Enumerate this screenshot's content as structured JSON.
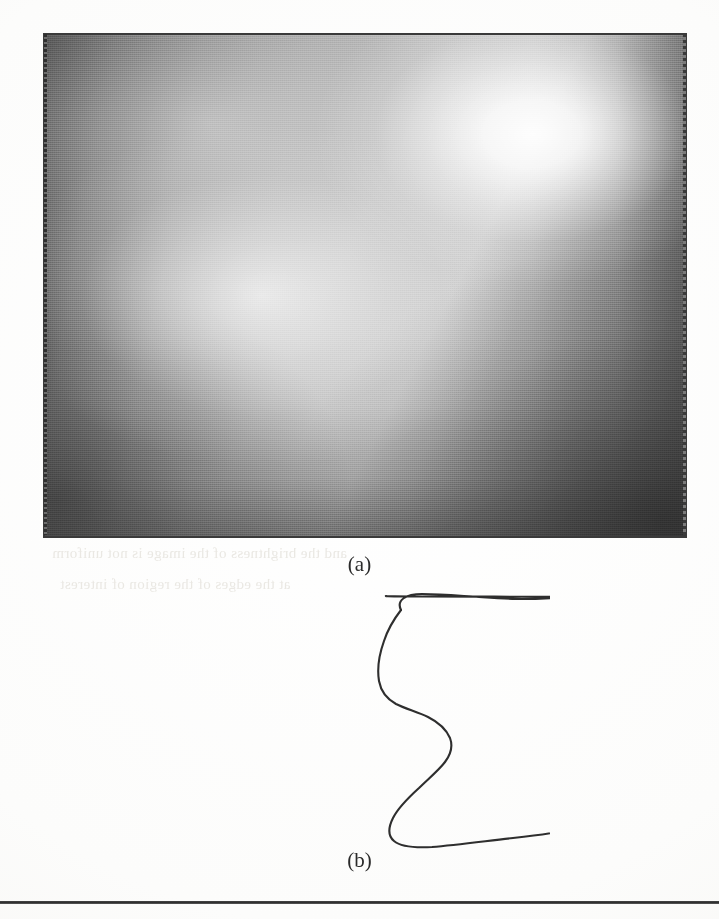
{
  "page": {
    "width": 719,
    "height": 919,
    "background_color": "#fdfdfc",
    "kind": "scanned-book-page-figure"
  },
  "figure_a": {
    "label": "(a)",
    "icon": "grayscale-gradient-image",
    "description": "Smooth grayscale intensity field with a bright highlight in the upper right and dark corners",
    "frame": {
      "x": 43,
      "y": 33,
      "width": 644,
      "height": 505
    },
    "border_color": "#3a3a3a",
    "tones": {
      "highlight": "#ffffff",
      "midtone": "#c8c8c8",
      "base": "#9a9a9a",
      "shadow_left": "#4a4a4a",
      "shadow_lower_right": "#575757"
    },
    "highlight_center": {
      "x": 530,
      "y": 135
    }
  },
  "figure_b": {
    "label": "(b)",
    "icon": "open-contour-outline",
    "description": "Hand-drawn closed-looking boundary curve with a gap along the top edge",
    "stroke_color": "#2e2e2e",
    "stroke_width": 2.1,
    "gap": {
      "left_endpoint_x": 386,
      "right_endpoint_x": 484,
      "y": 596
    },
    "bounds": {
      "left": 216,
      "right": 500,
      "top": 596,
      "bottom": 843
    },
    "path_left_branch": "M 216 34 C 214 17 228 8 250 8 C 282 8 320 10 355 13 C 380 15 400 18 216 34",
    "path_main": "M 216.5 26.5 C 214.5 15.5 223.5 8.5 239.5 8.5 C 261.5 8.5 288.5 10.0 311.5 11.5 C 332.5 13.0 349.5 14.5 362.5 15.5 C 378.5 16.8 392.0 17.5 400.5 18.2 L 400.5 18.2",
    "path_notch": "M 400.5 18.2 C 378.0 28.0 352.0 41.5 332.0 54.0 C 318.0 63.0 308.0 71.0 300.0 79.0 C 292.0 87.0 286.0 94.0 282.0 102.0 C 277.0 112.0 275.5 122.0 277.5 131.0 C 280.5 145.0 290.0 157.0 300.0 170.0 C 309.0 182.0 316.5 195.0 320.5 207.0 C 324.5 219.0 324.5 229.0 320.0 238.0 C 314.0 250.0 300.5 256.5 282.0 258.5 C 264.0 260.5 245.0 257.5 232.5 250.5 C 220.5 243.5 215.0 233.0 215.5 221.0 C 216.0 208.0 223.5 196.5 236.0 190.0",
    "path_right": "M 314.5 11.5 C 320.5 25.0 326.5 40.0 331.5 56.0 C 338.5 78.0 343.5 101.0 346.0 120.0 C 348.0 135.0 348.5 147.0 347.0 156.0 C 345.0 168.0 339.5 176.0 331.0 182.5 C 322.0 189.5 310.0 194.5 298.0 200.5 C 286.0 206.5 275.0 213.5 268.0 222.0 C 261.0 230.5 258.5 239.5 260.5 247.0 C 263.5 258.0 274.0 264.0 288.0 265.5"
  },
  "bleed_through": {
    "icon": "scan-bleed-through-text",
    "description": "Faint mirrored text showing through from the reverse side of the page",
    "color": "#e9e7e2",
    "lines": [
      "and the brightness of the image is not uniform",
      "at the edges of the region of interest"
    ]
  },
  "bottom_rule": {
    "icon": "horizontal-rule",
    "y": 901,
    "color": "#2c2c2c"
  }
}
